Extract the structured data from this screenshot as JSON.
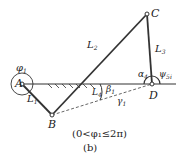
{
  "diagram": {
    "type": "four-bar linkage",
    "points": {
      "A": {
        "label": "A",
        "x": 22,
        "y": 84
      },
      "B": {
        "label": "B",
        "x": 52,
        "y": 115
      },
      "C": {
        "label": "C",
        "x": 147,
        "y": 14
      },
      "D": {
        "label": "D",
        "x": 152,
        "y": 84
      }
    },
    "links": [
      {
        "from": "A",
        "to": "B",
        "label": "L",
        "sub": "1"
      },
      {
        "from": "B",
        "to": "C",
        "label": "L",
        "sub": "2"
      },
      {
        "from": "C",
        "to": "D",
        "label": "L",
        "sub": "3"
      },
      {
        "from": "A",
        "to": "D",
        "label": "L",
        "sub": "4"
      }
    ],
    "angles": {
      "phi1": {
        "sym": "φ",
        "sub": "1"
      },
      "alpha": {
        "sym": "α",
        "sub": "4"
      },
      "psi": {
        "sym": "ψ",
        "sub": "5i"
      },
      "beta": {
        "sym": "β",
        "sub": "1"
      },
      "gamma": {
        "sym": "γ",
        "sub": "1"
      }
    },
    "condition": "(0<φ₁≤2π)",
    "subfigure": "(b)"
  }
}
